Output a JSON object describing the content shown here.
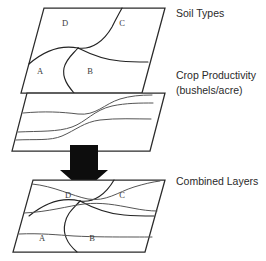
{
  "diagram": {
    "type": "layered-map-stack",
    "canvas": {
      "width": 266,
      "height": 261,
      "background": "#ffffff"
    },
    "colors": {
      "outline": "#2b2b2b",
      "soil_boundary": "#232323",
      "crop_contour": "#555555",
      "arrow": "#0d0d0d",
      "label_text": "#2a2a2a",
      "region_text": "#3a3a3a",
      "fill": "#ffffff"
    },
    "layers": [
      {
        "id": "soil-types",
        "label": "Soil Types",
        "label_lines": [
          "Soil Types"
        ],
        "label_x": 176,
        "label_y": 14,
        "polygon": "44,8 165,8 142,93 21,93",
        "regions": [
          {
            "code": "D",
            "x": 65,
            "y": 24
          },
          {
            "code": "C",
            "x": 122,
            "y": 24
          },
          {
            "code": "A",
            "x": 40,
            "y": 72
          },
          {
            "code": "B",
            "x": 90,
            "y": 72
          }
        ],
        "boundaries": [
          "M 29,64 C 45,50 62,45 78,48",
          "M 78,48 C 92,50 104,41 112,27 C 117,17 120,12 122,8",
          "M 78,48 C 90,54 104,60 120,61 C 131,62 140,62 148,62",
          "M 78,48 C 72,55 66,59 64,68 C 62,78 68,86 74,93"
        ]
      },
      {
        "id": "crop-productivity",
        "label": "Crop Productivity (bushels/acre)",
        "label_lines": [
          "Crop Productivity",
          "(bushels/acre)"
        ],
        "label_x": 176,
        "label_y": 76,
        "polygon": "27,93 165,93 150,151 12,151"
      },
      {
        "id": "combined-layers",
        "label": "Combined Layers",
        "label_lines": [
          "Combined Layers"
        ],
        "label_x": 176,
        "label_y": 182,
        "polygon": "33,180 165,180 145,252 13,252",
        "regions": [
          {
            "code": "D",
            "x": 68,
            "y": 196
          },
          {
            "code": "C",
            "x": 122,
            "y": 196
          },
          {
            "code": "A",
            "x": 42,
            "y": 239
          },
          {
            "code": "B",
            "x": 92,
            "y": 239
          }
        ]
      }
    ],
    "arrow": {
      "name": "downward-overlay-arrow",
      "shape": "70,145 98,145 98,170 108,170 84,191 60,170 70,170",
      "direction": "down"
    }
  }
}
